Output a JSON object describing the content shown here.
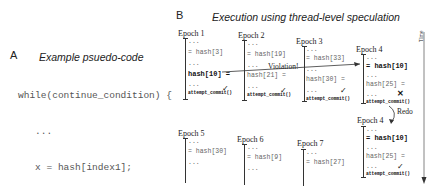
{
  "panel_a": {
    "label": "A",
    "title": "Example psuedo-code",
    "code_lines": [
      "while(continue_condition) {",
      "   ...",
      "   x = hash[index1];",
      "   ...",
      "   hash[index2] = y;",
      "   ...",
      "}"
    ]
  },
  "panel_b": {
    "label": "B",
    "title": "Execution using thread-level speculation",
    "time_label": "Time",
    "violation_label": "Violation!",
    "redo_label": "Redo",
    "check_mark": "✓",
    "cross_mark": "✕",
    "epochs": [
      {
        "title": "Epoch 1",
        "lines": [
          "...",
          "= hash[3]",
          "...",
          "hash[10] =",
          "..."
        ],
        "commit": "attempt_commit()",
        "status": "✓"
      },
      {
        "title": "Epoch 2",
        "lines": [
          "...",
          "= hash[19]",
          "...",
          "hash[21] =",
          "..."
        ],
        "commit": "attempt_commit()",
        "status": "✓"
      },
      {
        "title": "Epoch 3",
        "lines": [
          "...",
          "= hash[33]",
          "...",
          "hash[30] =",
          "..."
        ],
        "commit": "attempt_commit()",
        "status": "✓"
      },
      {
        "title": "Epoch 4",
        "lines": [
          "...",
          "= hash[10]",
          "...",
          "hash[25] =",
          "..."
        ],
        "commit": "attempt_commit()",
        "status": "✕"
      },
      {
        "title": "Epoch 5",
        "lines": [
          "...",
          "= hash[30]",
          "..."
        ]
      },
      {
        "title": "Epoch 6",
        "lines": [
          "...",
          "= hash[9]",
          "..."
        ]
      },
      {
        "title": "Epoch 7",
        "lines": [
          "...",
          "= hash[27]"
        ]
      },
      {
        "title": "Epoch 4",
        "lines": [
          "...",
          "= hash[10]",
          "...",
          "hash[25] =",
          "..."
        ],
        "commit": "attempt_commit()",
        "status": "✓"
      }
    ]
  }
}
